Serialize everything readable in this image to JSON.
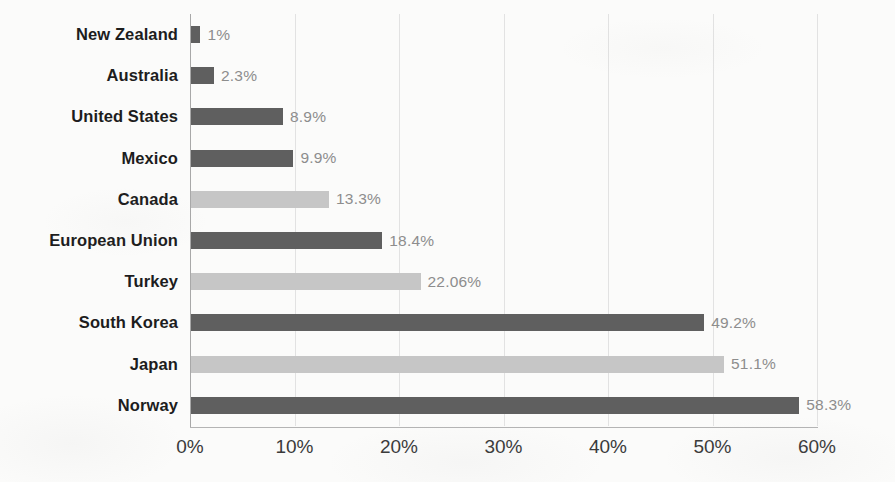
{
  "chart_data": {
    "type": "bar",
    "orientation": "horizontal",
    "title": "",
    "xlabel": "",
    "ylabel": "",
    "xlim": [
      0,
      60
    ],
    "xticks": [
      "0%",
      "10%",
      "20%",
      "30%",
      "40%",
      "50%",
      "60%"
    ],
    "xtick_values": [
      0,
      10,
      20,
      30,
      40,
      50,
      60
    ],
    "grid": true,
    "legend": "none",
    "categories": [
      "New Zealand",
      "Australia",
      "United States",
      "Mexico",
      "Canada",
      "European Union",
      "Turkey",
      "South Korea",
      "Japan",
      "Norway"
    ],
    "values": [
      1,
      2.3,
      8.9,
      9.9,
      13.3,
      18.4,
      22.06,
      49.2,
      51.1,
      58.3
    ],
    "value_labels": [
      "1%",
      "2.3%",
      "8.9%",
      "9.9%",
      "13.3%",
      "18.4%",
      "22.06%",
      "49.2%",
      "51.1%",
      "58.3%"
    ],
    "bar_shades": [
      "dark",
      "dark",
      "dark",
      "dark",
      "light",
      "dark",
      "light",
      "dark",
      "light",
      "dark"
    ],
    "colors": {
      "bar_dark": "#5f5f5f",
      "bar_light": "#c6c6c6",
      "gridline": "#e2e2e2",
      "axis": "#a8a8a8",
      "category_label": "#1d1d1d",
      "value_label": "#8d8d8d",
      "tick_label": "#3a3a3a",
      "background": "#fbfbfa"
    }
  }
}
